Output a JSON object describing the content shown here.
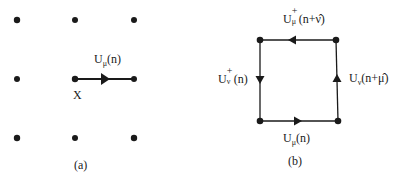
{
  "panel_a": {
    "caption": "(a)",
    "link_label": {
      "base": "U",
      "sub": "μ",
      "arg": "(n)"
    },
    "site_label": "X",
    "grid_points": [
      [
        17,
        20
      ],
      [
        75,
        20
      ],
      [
        134,
        20
      ],
      [
        17,
        79
      ],
      [
        75,
        79
      ],
      [
        134,
        79
      ],
      [
        17,
        138
      ],
      [
        75,
        138
      ],
      [
        134,
        138
      ]
    ],
    "link": {
      "from": [
        75,
        79
      ],
      "to": [
        134,
        79
      ],
      "arrow": "right"
    }
  },
  "panel_b": {
    "caption": "(b)",
    "corners": [
      [
        260,
        40
      ],
      [
        336,
        40
      ],
      [
        260,
        121
      ],
      [
        338,
        121
      ]
    ],
    "links": {
      "top": {
        "base": "U",
        "sup": "+",
        "sub": "μ",
        "arg": "(n+ν̂)",
        "arrow": "left"
      },
      "left": {
        "base": "U",
        "sup": "+",
        "sub": "ν",
        "arg": "(n)",
        "arrow": "down"
      },
      "right": {
        "base": "U",
        "sub": "ν",
        "arg": "(n+μ̂)",
        "arrow": "up"
      },
      "bottom": {
        "base": "U",
        "sub": "μ",
        "arg": "(n)",
        "arrow": "right"
      }
    }
  },
  "colors": {
    "ink": "#1a1a1a",
    "background": "#ffffff"
  }
}
